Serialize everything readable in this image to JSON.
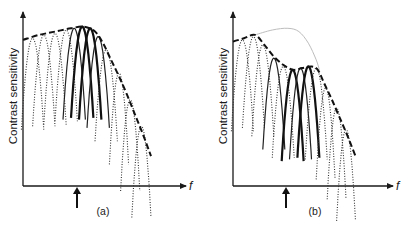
{
  "figure": {
    "panels": [
      {
        "id": "a",
        "caption": "(a)",
        "ylabel": "Contrast sensitivity",
        "xlabel": "f",
        "adapt_arrow": true,
        "channels": [
          {
            "peak_f": 0.06,
            "peak_s": 0.89,
            "width": 0.07,
            "style": "dotted"
          },
          {
            "peak_f": 0.13,
            "peak_s": 0.91,
            "width": 0.07,
            "style": "dotted"
          },
          {
            "peak_f": 0.2,
            "peak_s": 0.92,
            "width": 0.07,
            "style": "dotted"
          },
          {
            "peak_f": 0.27,
            "peak_s": 0.94,
            "width": 0.07,
            "style": "dotted"
          },
          {
            "peak_f": 0.32,
            "peak_s": 0.95,
            "width": 0.07,
            "style": "solid"
          },
          {
            "peak_f": 0.37,
            "peak_s": 0.96,
            "width": 0.07,
            "style": "thick"
          },
          {
            "peak_f": 0.42,
            "peak_s": 0.95,
            "width": 0.07,
            "style": "thick"
          },
          {
            "peak_f": 0.47,
            "peak_s": 0.9,
            "width": 0.07,
            "style": "solid"
          },
          {
            "peak_f": 0.52,
            "peak_s": 0.82,
            "width": 0.07,
            "style": "dotted"
          },
          {
            "peak_f": 0.6,
            "peak_s": 0.68,
            "width": 0.06,
            "style": "dotted"
          },
          {
            "peak_f": 0.67,
            "peak_s": 0.52,
            "width": 0.06,
            "style": "dotted"
          },
          {
            "peak_f": 0.74,
            "peak_s": 0.36,
            "width": 0.06,
            "style": "dotted"
          }
        ],
        "envelope": [
          [
            0.0,
            0.88
          ],
          [
            0.1,
            0.91
          ],
          [
            0.2,
            0.93
          ],
          [
            0.3,
            0.95
          ],
          [
            0.38,
            0.96
          ],
          [
            0.45,
            0.93
          ],
          [
            0.5,
            0.86
          ],
          [
            0.55,
            0.76
          ],
          [
            0.6,
            0.66
          ],
          [
            0.65,
            0.55
          ],
          [
            0.7,
            0.43
          ],
          [
            0.75,
            0.31
          ],
          [
            0.8,
            0.18
          ]
        ]
      },
      {
        "id": "b",
        "caption": "(b)",
        "ylabel": "Contrast sensitivity",
        "xlabel": "f",
        "adapt_arrow": true,
        "channels": [
          {
            "peak_f": 0.06,
            "peak_s": 0.88,
            "width": 0.07,
            "style": "dotted"
          },
          {
            "peak_f": 0.13,
            "peak_s": 0.9,
            "width": 0.07,
            "style": "dotted"
          },
          {
            "peak_f": 0.19,
            "peak_s": 0.85,
            "width": 0.07,
            "style": "dotted"
          },
          {
            "peak_f": 0.26,
            "peak_s": 0.77,
            "width": 0.07,
            "style": "solid"
          },
          {
            "peak_f": 0.32,
            "peak_s": 0.72,
            "width": 0.07,
            "style": "dotted"
          },
          {
            "peak_f": 0.38,
            "peak_s": 0.7,
            "width": 0.07,
            "style": "thick"
          },
          {
            "peak_f": 0.43,
            "peak_s": 0.71,
            "width": 0.07,
            "style": "solid"
          },
          {
            "peak_f": 0.48,
            "peak_s": 0.72,
            "width": 0.07,
            "style": "thick"
          },
          {
            "peak_f": 0.53,
            "peak_s": 0.71,
            "width": 0.07,
            "style": "dotted"
          },
          {
            "peak_f": 0.59,
            "peak_s": 0.59,
            "width": 0.06,
            "style": "dotted"
          },
          {
            "peak_f": 0.66,
            "peak_s": 0.47,
            "width": 0.06,
            "style": "dotted"
          },
          {
            "peak_f": 0.72,
            "peak_s": 0.34,
            "width": 0.06,
            "style": "dotted"
          }
        ],
        "envelope": [
          [
            0.0,
            0.87
          ],
          [
            0.07,
            0.89
          ],
          [
            0.14,
            0.91
          ],
          [
            0.2,
            0.85
          ],
          [
            0.26,
            0.78
          ],
          [
            0.32,
            0.73
          ],
          [
            0.38,
            0.7
          ],
          [
            0.44,
            0.71
          ],
          [
            0.5,
            0.72
          ],
          [
            0.54,
            0.7
          ],
          [
            0.58,
            0.62
          ],
          [
            0.63,
            0.52
          ],
          [
            0.68,
            0.41
          ],
          [
            0.73,
            0.3
          ],
          [
            0.78,
            0.18
          ]
        ],
        "original_envelope": [
          [
            0.14,
            0.91
          ],
          [
            0.25,
            0.94
          ],
          [
            0.35,
            0.95
          ],
          [
            0.42,
            0.93
          ],
          [
            0.48,
            0.86
          ],
          [
            0.53,
            0.76
          ],
          [
            0.55,
            0.7
          ]
        ]
      }
    ]
  }
}
